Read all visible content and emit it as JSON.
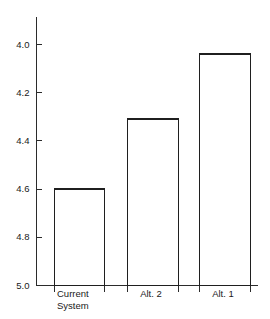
{
  "chart_data": {
    "type": "bar",
    "title": "",
    "subtitle": "",
    "xlabel": "",
    "ylabel": "",
    "categories": [
      "Current System",
      "Alt. 2",
      "Alt. 1"
    ],
    "values": [
      4.6,
      4.31,
      4.04
    ],
    "ylim": [
      4.0,
      5.0
    ],
    "y_axis_inverted": true,
    "y_ticks": [
      "4.0",
      "4.2",
      "4.4",
      "4.6",
      "4.8",
      "5.0"
    ],
    "y_tick_values": [
      4.0,
      4.2,
      4.4,
      4.6,
      4.8,
      5.0
    ],
    "grid": false,
    "legend": "none",
    "bar_style": "outline",
    "bar_fill_color": "#ffffff",
    "bar_stroke_color": "#1f1f1f",
    "axis_color": "#2b2b2b",
    "background_color": "#ffffff"
  },
  "axis": {
    "y_labels": [
      {
        "text": "4.0",
        "value": 4.0
      },
      {
        "text": "4.2",
        "value": 4.2
      },
      {
        "text": "4.4",
        "value": 4.4
      },
      {
        "text": "4.6",
        "value": 4.6
      },
      {
        "text": "4.8",
        "value": 4.8
      },
      {
        "text": "5.0",
        "value": 5.0
      }
    ]
  },
  "categories": [
    {
      "line1": "Current",
      "line2": "System",
      "value": 4.6
    },
    {
      "line1": "Alt. 2",
      "line2": "",
      "value": 4.31
    },
    {
      "line1": "Alt. 1",
      "line2": "",
      "value": 4.04
    }
  ]
}
